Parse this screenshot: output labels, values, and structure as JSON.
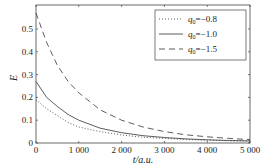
{
  "chart_data": {
    "type": "line",
    "title": "",
    "xlabel": "t/a.u.",
    "ylabel": "E",
    "xlim": [
      0,
      5000
    ],
    "ylim": [
      0,
      0.6
    ],
    "xticks": [
      "0",
      "1 000",
      "2 000",
      "3 000",
      "4 000",
      "5 000"
    ],
    "yticks": [
      "0",
      "0.1",
      "0.2",
      "0.3",
      "0.4",
      "0.5"
    ],
    "grid": false,
    "legend_position": "upper right",
    "x": [
      0,
      250,
      500,
      750,
      1000,
      1500,
      2000,
      2500,
      3000,
      3500,
      4000,
      4500,
      5000
    ],
    "series": [
      {
        "name": "q0=-0.8",
        "style": "dotted",
        "values": [
          0.19,
          0.15,
          0.12,
          0.09,
          0.07,
          0.05,
          0.035,
          0.025,
          0.02,
          0.015,
          0.012,
          0.01,
          0.008
        ]
      },
      {
        "name": "q0=-1.0",
        "style": "solid",
        "values": [
          0.27,
          0.2,
          0.16,
          0.125,
          0.1,
          0.065,
          0.045,
          0.032,
          0.024,
          0.018,
          0.014,
          0.011,
          0.009
        ]
      },
      {
        "name": "q0=-1.5",
        "style": "dashed",
        "values": [
          0.57,
          0.44,
          0.34,
          0.27,
          0.22,
          0.145,
          0.1,
          0.07,
          0.05,
          0.036,
          0.027,
          0.02,
          0.015
        ]
      }
    ]
  },
  "legend": [
    {
      "prefix": "q",
      "sub": "0",
      "value": "=−0.8"
    },
    {
      "prefix": "q",
      "sub": "0",
      "value": "=−1.0"
    },
    {
      "prefix": "q",
      "sub": "0",
      "value": "=−1.5"
    }
  ],
  "axes": {
    "xlabel": "t/a.u.",
    "ylabel": "E"
  }
}
